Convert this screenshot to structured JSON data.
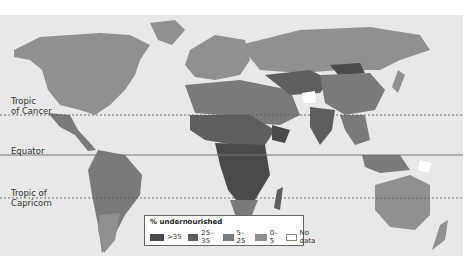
{
  "map": {
    "lines": [
      {
        "name": "Tropic of Cancer",
        "label_lines": [
          "Tropic",
          "of Cancer"
        ],
        "style": "dotted"
      },
      {
        "name": "Equator",
        "label_lines": [
          "Equator"
        ],
        "style": "solid"
      },
      {
        "name": "Tropic of Capricorn",
        "label_lines": [
          "Tropic of",
          "Capricorn"
        ],
        "style": "dotted"
      }
    ],
    "colors": {
      "background": "#e8e8e8",
      "gt35": "#4a4a4a",
      "25_35": "#5e5e5e",
      "5_25": "#7a7a7a",
      "0_5": "#909090",
      "no_data": "#ffffff"
    }
  },
  "legend": {
    "title": "% undernourished",
    "items": [
      {
        "label": ">35",
        "color": "#4a4a4a"
      },
      {
        "label": "25–35",
        "color": "#5e5e5e"
      },
      {
        "label": "5–25",
        "color": "#7a7a7a"
      },
      {
        "label": "0–5",
        "color": "#909090"
      },
      {
        "label": "No data",
        "color": "#ffffff"
      }
    ]
  }
}
